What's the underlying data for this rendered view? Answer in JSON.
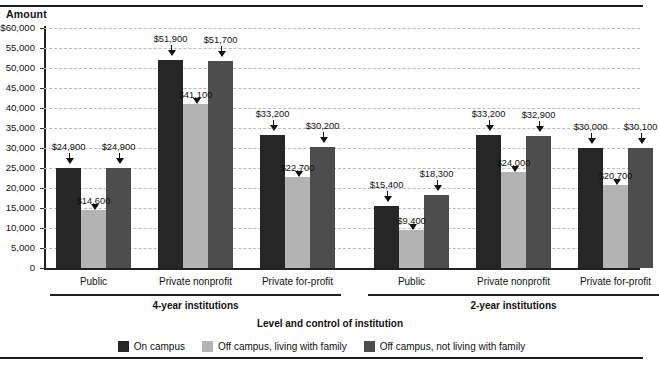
{
  "figure": {
    "y_axis_title": "Amount",
    "x_axis_title": "Level and control of institution"
  },
  "chart_data": {
    "type": "bar",
    "title": "",
    "xlabel": "Level and control of institution",
    "ylabel": "Amount",
    "ylim": [
      0,
      60000
    ],
    "ytick_values": [
      60000,
      55000,
      50000,
      45000,
      40000,
      35000,
      30000,
      25000,
      20000,
      15000,
      10000,
      5000,
      0
    ],
    "ytick_labels": [
      "$60,000",
      "55,000",
      "50,000",
      "45,000",
      "40,000",
      "35,000",
      "30,000",
      "25,000",
      "20,000",
      "15,000",
      "10,000",
      "5,000",
      "0"
    ],
    "grid": true,
    "legend_position": "bottom",
    "series": [
      {
        "name": "On campus",
        "color": "#262626",
        "values": [
          24900,
          51900,
          33200,
          15400,
          33200,
          30000
        ],
        "labels": [
          "$24,900",
          "$51,900",
          "$33,200",
          "$15,400",
          "$33,200",
          "$30,000"
        ]
      },
      {
        "name": "Off campus, living with family",
        "color": "#b3b3b3",
        "values": [
          14600,
          41100,
          22700,
          9400,
          24000,
          20700
        ],
        "labels": [
          "$14,600",
          "$41,100",
          "$22,700",
          "$9,400",
          "$24,000",
          "$20,700"
        ]
      },
      {
        "name": "Off campus, not living with family",
        "color": "#4d4d4d",
        "values": [
          24900,
          51700,
          30200,
          18300,
          32900,
          30100
        ],
        "labels": [
          "$24,900",
          "$51,700",
          "$30,200",
          "$18,300",
          "$32,900",
          "$30,100"
        ]
      }
    ],
    "categories": [
      "Public",
      "Private nonprofit",
      "Private for-profit",
      "Public",
      "Private nonprofit",
      "Private for-profit"
    ],
    "groups": [
      {
        "label": "4-year institutions",
        "categories": [
          0,
          1,
          2
        ]
      },
      {
        "label": "2-year institutions",
        "categories": [
          3,
          4,
          5
        ]
      }
    ]
  },
  "legend": {
    "items": [
      {
        "label": "On campus",
        "color": "#262626"
      },
      {
        "label": "Off campus, living with family",
        "color": "#b3b3b3"
      },
      {
        "label": "Off campus, not living with family",
        "color": "#4d4d4d"
      }
    ]
  }
}
